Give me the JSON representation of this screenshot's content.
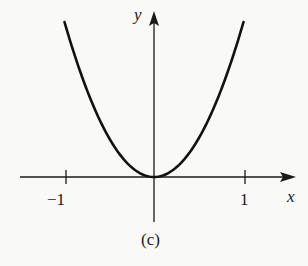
{
  "chart_data": {
    "type": "line",
    "title": "",
    "caption": "(c)",
    "xlabel": "x",
    "ylabel": "y",
    "x_ticks": [
      -1,
      1
    ],
    "x_tick_labels": [
      "−1",
      "1"
    ],
    "y_ticks": [],
    "xlim": [
      -1.1,
      1.1
    ],
    "ylim": [
      -0.25,
      1.1
    ],
    "grid": false,
    "legend": null,
    "series": [
      {
        "name": "y = x^2",
        "x": [
          -1.0,
          -0.75,
          -0.5,
          -0.25,
          0.0,
          0.25,
          0.5,
          0.75,
          1.0
        ],
        "y": [
          1.0,
          0.5625,
          0.25,
          0.0625,
          0.0,
          0.0625,
          0.25,
          0.5625,
          1.0
        ]
      }
    ]
  },
  "labels": {
    "x_axis": "x",
    "y_axis": "y",
    "tick_neg1": "−1",
    "tick_pos1": "1",
    "caption": "(c)"
  },
  "colors": {
    "ink": "#1a1a1a",
    "background": "#f9f9f8"
  }
}
